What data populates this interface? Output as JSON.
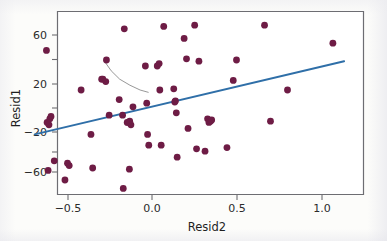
{
  "figure": {
    "kind": "scatterplot-with-fit",
    "background_color": "#fcfcfa"
  },
  "chart_data": {
    "type": "scatter",
    "title": "",
    "xlabel": "Resid2",
    "ylabel": "Resid1",
    "xlim": [
      -0.69,
      1.13
    ],
    "ylim": [
      -74,
      73
    ],
    "xticks": [
      -0.5,
      0.0,
      0.5,
      1.0
    ],
    "xticklabels": [
      "−0.5",
      "0.0",
      "0.5",
      "1.0"
    ],
    "yticks": [
      60,
      20,
      -20,
      -60
    ],
    "yticklabels": [
      "60",
      "20",
      "−20",
      "−60"
    ],
    "grid": false,
    "legend": null,
    "marker": {
      "shape": "circle",
      "color": "#6e1c45",
      "radius_px": 3.4
    },
    "points": [
      {
        "x": -0.621,
        "y": 48
      },
      {
        "x": -0.617,
        "y": -12
      },
      {
        "x": -0.611,
        "y": -52
      },
      {
        "x": -0.606,
        "y": -14
      },
      {
        "x": -0.601,
        "y": -9
      },
      {
        "x": -0.594,
        "y": -7
      },
      {
        "x": -0.575,
        "y": -44
      },
      {
        "x": -0.512,
        "y": -60
      },
      {
        "x": -0.497,
        "y": -46
      },
      {
        "x": -0.487,
        "y": -48
      },
      {
        "x": -0.417,
        "y": 15
      },
      {
        "x": -0.359,
        "y": -22
      },
      {
        "x": -0.349,
        "y": -50
      },
      {
        "x": -0.296,
        "y": 24
      },
      {
        "x": -0.289,
        "y": 24
      },
      {
        "x": -0.272,
        "y": 22
      },
      {
        "x": -0.268,
        "y": 40
      },
      {
        "x": -0.252,
        "y": -6
      },
      {
        "x": -0.193,
        "y": 7
      },
      {
        "x": -0.173,
        "y": -6
      },
      {
        "x": -0.169,
        "y": -67
      },
      {
        "x": -0.163,
        "y": 66
      },
      {
        "x": -0.146,
        "y": -12
      },
      {
        "x": -0.139,
        "y": -12
      },
      {
        "x": -0.133,
        "y": -51
      },
      {
        "x": -0.131,
        "y": -11
      },
      {
        "x": -0.124,
        "y": -14
      },
      {
        "x": -0.112,
        "y": 1
      },
      {
        "x": -0.039,
        "y": 35
      },
      {
        "x": -0.031,
        "y": 4
      },
      {
        "x": -0.026,
        "y": -22
      },
      {
        "x": -0.019,
        "y": -31
      },
      {
        "x": 0.031,
        "y": 35
      },
      {
        "x": 0.042,
        "y": 37
      },
      {
        "x": 0.046,
        "y": 15
      },
      {
        "x": 0.054,
        "y": -31
      },
      {
        "x": 0.069,
        "y": 68
      },
      {
        "x": 0.128,
        "y": 16
      },
      {
        "x": 0.134,
        "y": 5
      },
      {
        "x": 0.138,
        "y": 6
      },
      {
        "x": 0.143,
        "y": -4
      },
      {
        "x": 0.148,
        "y": -41
      },
      {
        "x": 0.189,
        "y": 58
      },
      {
        "x": 0.203,
        "y": 41
      },
      {
        "x": 0.212,
        "y": -17
      },
      {
        "x": 0.251,
        "y": 69
      },
      {
        "x": 0.262,
        "y": -34
      },
      {
        "x": 0.276,
        "y": 39
      },
      {
        "x": 0.312,
        "y": -36
      },
      {
        "x": 0.327,
        "y": -9
      },
      {
        "x": 0.335,
        "y": -12
      },
      {
        "x": 0.344,
        "y": -11
      },
      {
        "x": 0.351,
        "y": -10
      },
      {
        "x": 0.441,
        "y": -33
      },
      {
        "x": 0.478,
        "y": 23
      },
      {
        "x": 0.497,
        "y": 40
      },
      {
        "x": 0.662,
        "y": 69
      },
      {
        "x": 0.697,
        "y": -11
      },
      {
        "x": 0.797,
        "y": 15
      },
      {
        "x": 1.064,
        "y": 54
      }
    ],
    "fit_line": {
      "name": "linear-fit",
      "color": "#2f6fa8",
      "x_start": -0.69,
      "y_start": -22,
      "x_end": 1.13,
      "y_end": 39
    },
    "smooth_curve": {
      "name": "lowess-smoother",
      "color": "#8b8b8b",
      "points": [
        {
          "x": -0.285,
          "y": 40
        },
        {
          "x": -0.24,
          "y": 31
        },
        {
          "x": -0.19,
          "y": 24
        },
        {
          "x": -0.13,
          "y": 19
        },
        {
          "x": -0.07,
          "y": 15
        },
        {
          "x": -0.02,
          "y": 13
        }
      ]
    }
  }
}
